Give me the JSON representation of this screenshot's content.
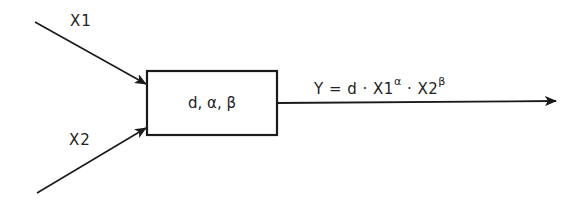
{
  "diagram": {
    "type": "block-diagram",
    "inputs": [
      {
        "label": "X1"
      },
      {
        "label": "X2"
      }
    ],
    "block": {
      "label": "d, α, β",
      "parameters": [
        "d",
        "α",
        "β"
      ]
    },
    "output": {
      "formula_parts": {
        "lhs": "Y = d · X1",
        "exp1": "α",
        "mid": " · X2",
        "exp2": "β"
      },
      "formula_text": "Y = d · X1^α · X2^β"
    },
    "colors": {
      "stroke": "#1a1a1a",
      "background": "#ffffff"
    }
  }
}
